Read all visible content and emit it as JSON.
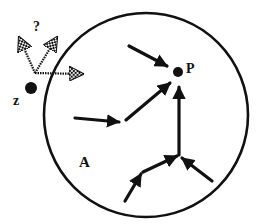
{
  "diagram": {
    "type": "vector-field-basin",
    "region": {
      "label": "A",
      "shape": "circle",
      "center": [
        146,
        115
      ],
      "radius": 102
    },
    "attractor": {
      "label": "P",
      "position": [
        178,
        72
      ],
      "radius": 5
    },
    "external_point": {
      "label": "z",
      "position": [
        31,
        88
      ],
      "radius": 6
    },
    "question_mark": "?",
    "inner_arrows": [
      {
        "from": [
          129,
          46
        ],
        "to": [
          167,
          66
        ]
      },
      {
        "from": [
          126,
          120
        ],
        "to": [
          170,
          83
        ]
      },
      {
        "from": [
          75,
          118
        ],
        "to": [
          119,
          122
        ]
      },
      {
        "from": [
          179,
          155
        ],
        "to": [
          179,
          87
        ]
      },
      {
        "from": [
          143,
          172
        ],
        "to": [
          177,
          156
        ]
      },
      {
        "from": [
          212,
          181
        ],
        "to": [
          182,
          158
        ]
      },
      {
        "from": [
          125,
          201
        ],
        "to": [
          141,
          174
        ]
      }
    ],
    "hatched_arrows": [
      {
        "from": [
          35,
          73
        ],
        "to": [
          19,
          37
        ]
      },
      {
        "from": [
          35,
          73
        ],
        "to": [
          57,
          37
        ]
      },
      {
        "from": [
          35,
          73
        ],
        "to": [
          83,
          74
        ]
      }
    ],
    "colors": {
      "stroke": "#111111",
      "background": "#ffffff"
    }
  }
}
